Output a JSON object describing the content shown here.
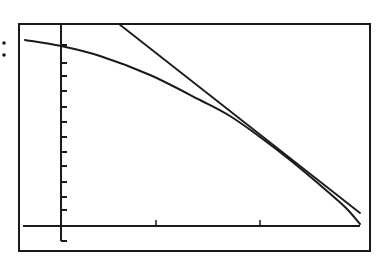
{
  "chart_data": {
    "type": "line",
    "title": "",
    "xlabel": "",
    "ylabel": "",
    "grid": false,
    "legend": null,
    "label_marker": ":",
    "frame": {
      "left": 19,
      "top": 24,
      "right": 370,
      "bottom": 251
    },
    "axes": {
      "y_axis_x": 61,
      "y_axis_top": 24,
      "y_axis_bottom": 241,
      "x_axis_y": 226,
      "x_axis_left": 23,
      "x_axis_right": 360,
      "y_tick_positions": [
        45,
        63,
        76,
        91,
        107,
        122,
        137,
        152,
        166,
        182,
        197,
        210,
        241
      ],
      "x_tick_positions": [
        156,
        260
      ],
      "y_tick_count_above_x_axis": 12,
      "x_tick_count": 2
    },
    "series": [
      {
        "name": "curve",
        "kind": "concave-down curve",
        "points_px": [
          [
            25,
            40
          ],
          [
            61,
            46
          ],
          [
            100,
            56
          ],
          [
            150,
            75
          ],
          [
            200,
            100
          ],
          [
            230,
            116
          ],
          [
            260,
            137
          ],
          [
            290,
            160
          ],
          [
            320,
            185
          ],
          [
            345,
            207
          ],
          [
            360,
            224
          ]
        ]
      },
      {
        "name": "tangent-line",
        "kind": "straight line tangent to curve",
        "points_px": [
          [
            119,
            24
          ],
          [
            360,
            213
          ]
        ],
        "tangent_point_px": [
          255,
          133
        ]
      }
    ],
    "colors": {
      "ink": "#1a1a1a",
      "background": "#ffffff"
    }
  }
}
